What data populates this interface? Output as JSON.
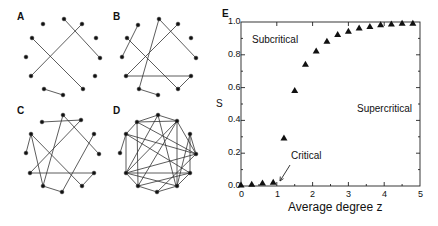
{
  "panels": {
    "A": {
      "label": "A"
    },
    "B": {
      "label": "B"
    },
    "C": {
      "label": "C"
    },
    "D": {
      "label": "D"
    },
    "E": {
      "label": "E"
    }
  },
  "chart_data": {
    "type": "scatter",
    "title": "",
    "xlabel": "Average degree z",
    "ylabel": "S",
    "xlim": [
      0,
      5
    ],
    "ylim": [
      0,
      1.0
    ],
    "xticks": [
      "0",
      "1",
      "2",
      "3",
      "4",
      "5"
    ],
    "yticks": [
      "0.0",
      "0.2",
      "0.4",
      "0.6",
      "0.8",
      "1.0"
    ],
    "marker": "triangle",
    "x": [
      0,
      0.3,
      0.6,
      0.9,
      1.2,
      1.5,
      1.8,
      2.1,
      2.4,
      2.7,
      3.0,
      3.3,
      3.6,
      3.9,
      4.2,
      4.5,
      4.8
    ],
    "y": [
      0.003,
      0.008,
      0.015,
      0.02,
      0.29,
      0.58,
      0.74,
      0.82,
      0.88,
      0.92,
      0.94,
      0.96,
      0.97,
      0.98,
      0.985,
      0.99,
      0.99
    ],
    "annotations": [
      {
        "text": "Subcritical",
        "x": 0.55,
        "y": 0.88
      },
      {
        "text": "Supercritical",
        "x": 3.5,
        "y": 0.45
      },
      {
        "text": "Critical",
        "x": 1.55,
        "y": 0.18,
        "arrow_to": [
          1.0,
          0.02
        ]
      }
    ],
    "grid": false
  }
}
